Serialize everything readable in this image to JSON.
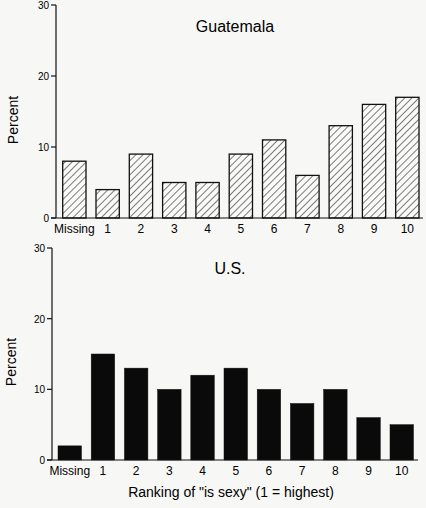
{
  "chart_data": [
    {
      "type": "bar",
      "title": "Guatemala",
      "xlabel": "",
      "ylabel": "Percent",
      "ylim": [
        0,
        30
      ],
      "yticks": [
        0,
        10,
        20,
        30
      ],
      "grid": false,
      "fill": "hatched",
      "categories": [
        "Missing",
        "1",
        "2",
        "3",
        "4",
        "5",
        "6",
        "7",
        "8",
        "9",
        "10"
      ],
      "values": [
        8,
        4,
        9,
        5,
        5,
        9,
        11,
        6,
        13,
        16,
        17
      ]
    },
    {
      "type": "bar",
      "title": "U.S.",
      "xlabel": "Ranking of \"is sexy\" (1 = highest)",
      "ylabel": "Percent",
      "ylim": [
        0,
        30
      ],
      "yticks": [
        0,
        10,
        20,
        30
      ],
      "grid": false,
      "fill": "solid black",
      "categories": [
        "Missing",
        "1",
        "2",
        "3",
        "4",
        "5",
        "6",
        "7",
        "8",
        "9",
        "10"
      ],
      "values": [
        2,
        15,
        13,
        10,
        12,
        13,
        10,
        8,
        10,
        6,
        5
      ]
    }
  ],
  "colors": {
    "ink": "#111111",
    "background": "#f7f7f5"
  }
}
